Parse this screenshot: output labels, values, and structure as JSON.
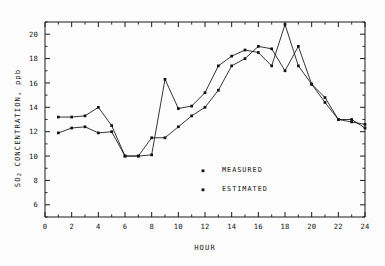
{
  "chart_data": {
    "type": "line",
    "title": "",
    "xlabel": "HOUR",
    "ylabel": "SO2 CONCENTRATION, ppb",
    "ylabel_parts": {
      "main": "SO",
      "sub": "2",
      "rest": " CONCENTRATION, ppb"
    },
    "xlim": [
      0,
      24
    ],
    "ylim": [
      5,
      21
    ],
    "xticks": [
      0,
      2,
      4,
      6,
      8,
      10,
      12,
      14,
      16,
      18,
      20,
      22,
      24
    ],
    "xtick_labels": [
      "0",
      "2",
      "4",
      "6",
      "8",
      "10",
      "12",
      "14",
      "16",
      "18",
      "20",
      "22",
      "24"
    ],
    "xminor_step": 1,
    "yticks": [
      6,
      8,
      10,
      12,
      14,
      16,
      18,
      20
    ],
    "ytick_labels": [
      "6",
      "8",
      "10",
      "12",
      "14",
      "16",
      "18",
      "20"
    ],
    "yminor_step": 1,
    "grid": false,
    "legend_position": "inside-center",
    "x": [
      1,
      2,
      3,
      4,
      5,
      6,
      7,
      8,
      9,
      10,
      11,
      12,
      13,
      14,
      15,
      16,
      17,
      18,
      19,
      20,
      21,
      22,
      23,
      24
    ],
    "series": [
      {
        "name": "MEASURED",
        "marker": "square",
        "color": "#121212",
        "values": [
          13.2,
          13.2,
          13.3,
          14.0,
          12.5,
          10.0,
          10.0,
          10.1,
          16.3,
          13.9,
          14.1,
          15.2,
          17.4,
          18.2,
          18.7,
          18.5,
          17.4,
          20.8,
          17.4,
          15.9,
          14.4,
          13.0,
          12.8,
          12.6
        ]
      },
      {
        "name": "ESTIMATED",
        "marker": "square",
        "color": "#121212",
        "values": [
          11.9,
          12.3,
          12.4,
          11.9,
          12.0,
          10.0,
          10.0,
          11.5,
          11.5,
          12.4,
          13.3,
          14.0,
          15.4,
          17.4,
          18.0,
          19.0,
          18.8,
          17.0,
          19.0,
          15.9,
          14.8,
          13.0,
          13.0,
          12.3
        ]
      }
    ],
    "legend": [
      {
        "label": "MEASURED",
        "marker": "square",
        "color": "#121212"
      },
      {
        "label": "ESTIMATED",
        "marker": "square",
        "color": "#121212"
      }
    ]
  },
  "colors": {
    "background": "#fcfcfc",
    "axis": "#1a1a1a",
    "ink": "#121212"
  }
}
